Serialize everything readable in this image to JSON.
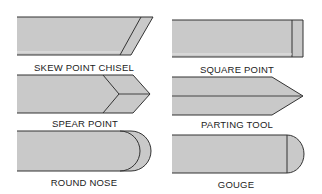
{
  "figure": {
    "colors": {
      "fill": "#c8c8c8",
      "fill_light": "#d4d4d4",
      "stroke": "#333333",
      "background": "#ffffff"
    },
    "tools": [
      {
        "id": "skew-point-chisel",
        "label": "SKEW POINT CHISEL",
        "column": "left",
        "row": 1
      },
      {
        "id": "square-point",
        "label": "SQUARE POINT",
        "column": "right",
        "row": 1
      },
      {
        "id": "spear-point",
        "label": "SPEAR POINT",
        "column": "left",
        "row": 2
      },
      {
        "id": "parting-tool",
        "label": "PARTING TOOL",
        "column": "right",
        "row": 2
      },
      {
        "id": "round-nose",
        "label": "ROUND NOSE",
        "column": "left",
        "row": 3
      },
      {
        "id": "gouge",
        "label": "GOUGE",
        "column": "right",
        "row": 3
      }
    ]
  }
}
